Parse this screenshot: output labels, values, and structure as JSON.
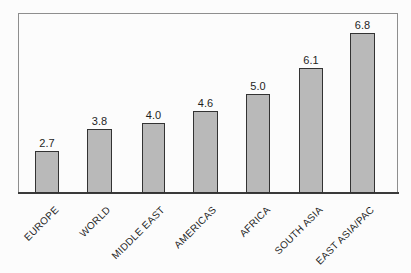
{
  "chart_data": {
    "type": "bar",
    "orientation": "vertical",
    "title": "",
    "xlabel": "",
    "ylabel": "",
    "grid": false,
    "legend": false,
    "categories": [
      "EUROPE",
      "WORLD",
      "MIDDLE EAST",
      "AMERICAS",
      "AFRICA",
      "SOUTH ASIA",
      "EAST ASIA/PAC"
    ],
    "values": [
      2.7,
      3.8,
      4.0,
      4.6,
      5.0,
      6.1,
      6.8
    ],
    "value_labels": [
      "2.7",
      "3.8",
      "4.0",
      "4.6",
      "5.0",
      "6.1",
      "6.8"
    ],
    "axis_range_implied": [
      0,
      7
    ],
    "layout_px": {
      "frame": {
        "left": 18,
        "top": 13,
        "width": 380,
        "height": 179
      },
      "baseline_y": 193,
      "bar_lefts": [
        35,
        87,
        142,
        193,
        246,
        299,
        350
      ],
      "bar_widths": [
        24,
        25,
        23,
        25,
        24,
        24,
        25
      ],
      "bar_heights": [
        42,
        64,
        70,
        82,
        99,
        125,
        160
      ],
      "label_anchor_xs": [
        53,
        105,
        159,
        211,
        264,
        317,
        368
      ],
      "label_top_y": 204,
      "label_rotation_deg": -45
    }
  },
  "colors": {
    "background": "#fcfcfc",
    "bar_fill": "#b9b9b9",
    "bar_border": "#333333",
    "frame_border": "#8e8e8e",
    "axis_line": "#3a3a3a",
    "text": "#1f1f1f"
  }
}
